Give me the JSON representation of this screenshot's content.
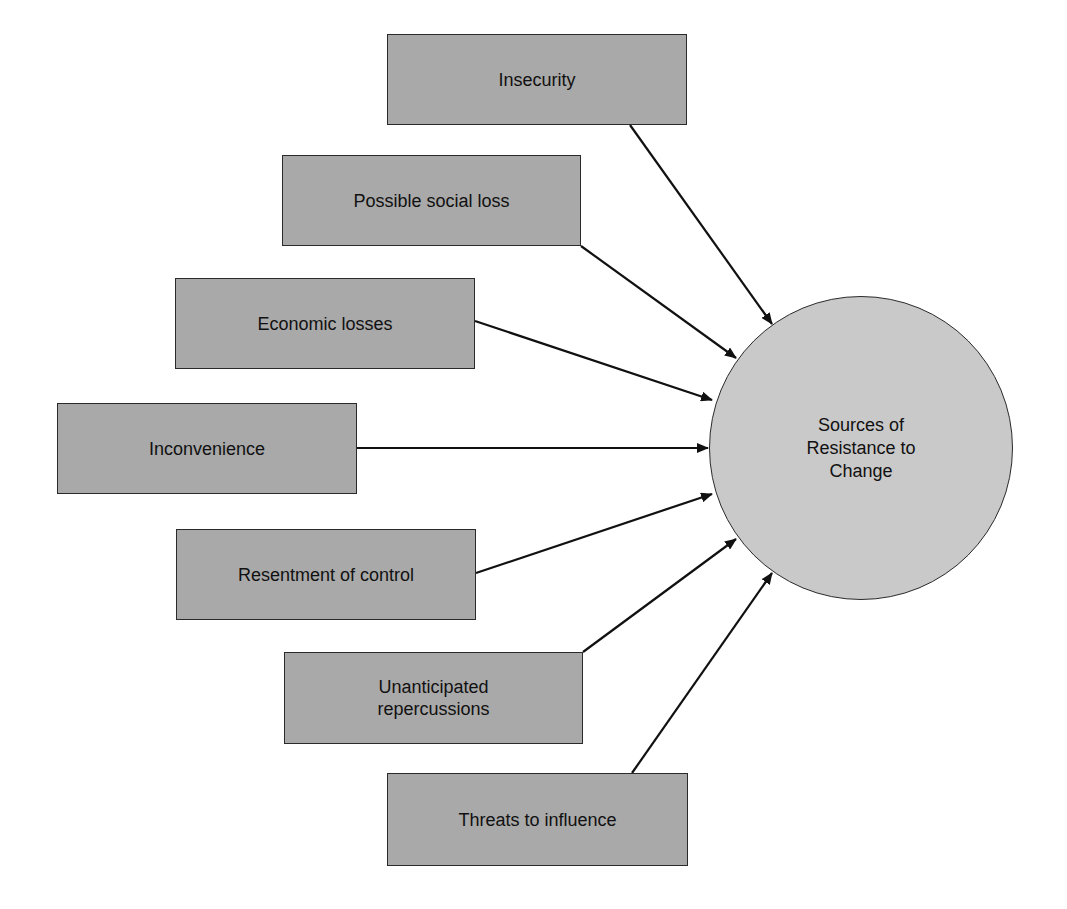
{
  "diagram": {
    "colors": {
      "box_fill": "#a9a9a9",
      "circle_fill": "#c9c9c9",
      "stroke": "#111111",
      "background": "#ffffff"
    },
    "center_node": {
      "label": "Sources of\nResistance to\nChange",
      "cx": 861,
      "cy": 448,
      "r": 152
    },
    "source_nodes": [
      {
        "label": "Insecurity",
        "x": 387,
        "y": 34,
        "w": 300,
        "h": 91,
        "arrow": [
          630,
          125,
          772,
          324
        ]
      },
      {
        "label": "Possible social loss",
        "x": 282,
        "y": 155,
        "w": 299,
        "h": 91,
        "arrow": [
          581,
          246,
          736,
          358
        ]
      },
      {
        "label": "Economic losses",
        "x": 175,
        "y": 278,
        "w": 300,
        "h": 91,
        "arrow": [
          475,
          321,
          712,
          400
        ]
      },
      {
        "label": "Inconvenience",
        "x": 57,
        "y": 403,
        "w": 300,
        "h": 91,
        "arrow": [
          357,
          448,
          708,
          448
        ]
      },
      {
        "label": "Resentment of control",
        "x": 176,
        "y": 529,
        "w": 300,
        "h": 91,
        "arrow": [
          476,
          573,
          712,
          494
        ]
      },
      {
        "label": "Unanticipated\nrepercussions",
        "x": 284,
        "y": 652,
        "w": 299,
        "h": 92,
        "arrow": [
          583,
          652,
          736,
          539
        ]
      },
      {
        "label": "Threats to influence",
        "x": 387,
        "y": 773,
        "w": 301,
        "h": 93,
        "arrow": [
          632,
          773,
          772,
          573
        ]
      }
    ]
  }
}
